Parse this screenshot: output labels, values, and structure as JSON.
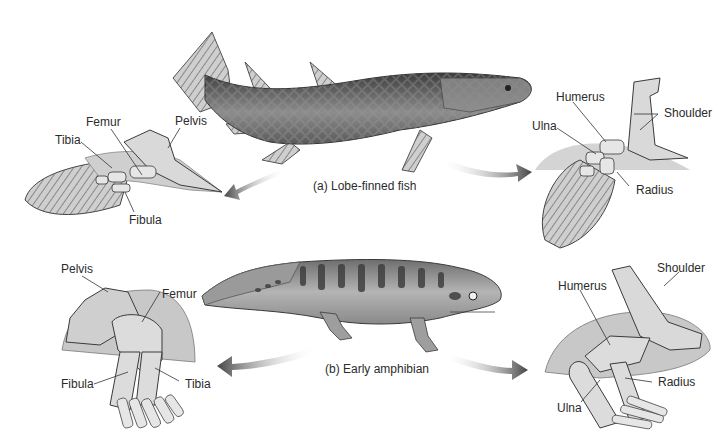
{
  "panels": {
    "fish": {
      "caption": "(a) Lobe-finned fish",
      "pelvic_fin": {
        "labels": {
          "femur": "Femur",
          "pelvis": "Pelvis",
          "tibia": "Tibia",
          "fibula": "Fibula"
        }
      },
      "pectoral_fin": {
        "labels": {
          "humerus": "Humerus",
          "shoulder": "Shoulder",
          "ulna": "Ulna",
          "radius": "Radius"
        }
      }
    },
    "amphibian": {
      "caption": "(b) Early amphibian",
      "hind_limb": {
        "labels": {
          "pelvis": "Pelvis",
          "femur": "Femur",
          "fibula": "Fibula",
          "tibia": "Tibia"
        }
      },
      "fore_limb": {
        "labels": {
          "shoulder": "Shoulder",
          "humerus": "Humerus",
          "radius": "Radius",
          "ulna": "Ulna"
        }
      }
    }
  },
  "colors": {
    "background": "#ffffff",
    "label_text": "#2b2b2b",
    "bone_fill": "#d9d9d9",
    "bone_stroke": "#3a3a3a",
    "animal_dark": "#4a4a4a",
    "animal_mid": "#8a8a8a",
    "arrow": "#555555"
  }
}
